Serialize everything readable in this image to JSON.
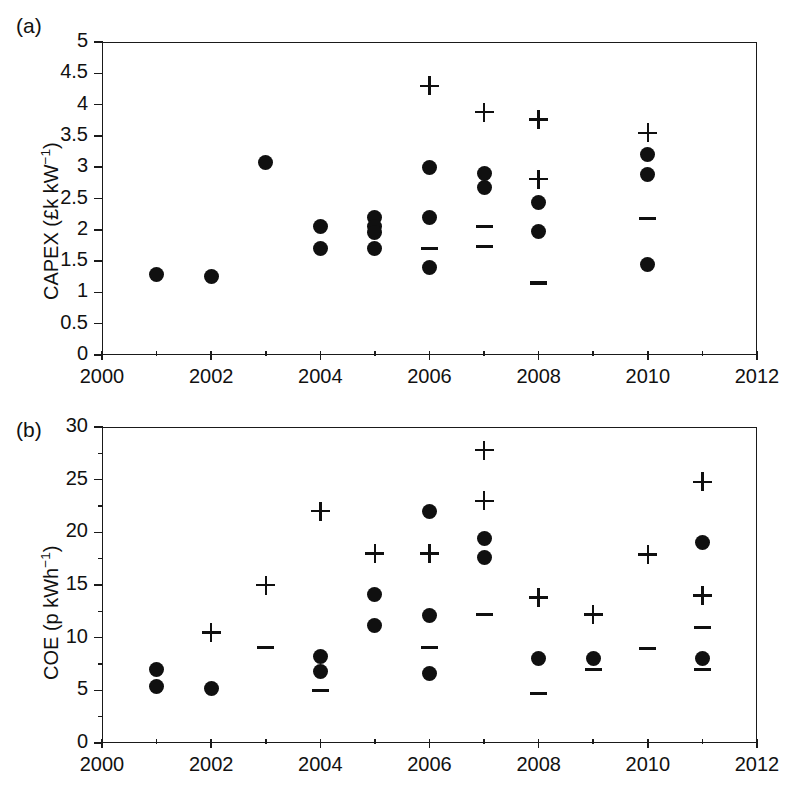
{
  "figure": {
    "panel_a_label": "(a)",
    "panel_b_label": "(b)",
    "caption_fragment": ""
  },
  "chart_data": [
    {
      "id": "panel-a",
      "type": "scatter",
      "title": "(a)",
      "xlabel": "",
      "ylabel": "CAPEX (£k kW-1)",
      "ylabel_html": "CAPEX (£k kW<sup>−1</sup>)",
      "xlim": [
        2000,
        2012
      ],
      "ylim": [
        0,
        5
      ],
      "xticks": [
        2000,
        2002,
        2004,
        2006,
        2008,
        2010,
        2012
      ],
      "xtick_labels": [
        "2000",
        "2002",
        "2004",
        "2006",
        "2008",
        "2010",
        "2012"
      ],
      "xtick_minor": [
        2001,
        2003,
        2005,
        2007,
        2009,
        2011
      ],
      "yticks": [
        0,
        0.5,
        1,
        1.5,
        2,
        2.5,
        3,
        3.5,
        4,
        4.5,
        5
      ],
      "ytick_labels": [
        "0",
        "0.5",
        "1",
        "1.5",
        "2",
        "2.5",
        "3",
        "3.5",
        "4",
        "4.5",
        "5"
      ],
      "grid": false,
      "legend": null,
      "series": [
        {
          "name": "central estimate",
          "marker": "dot",
          "points": [
            {
              "x": 2001,
              "y": 1.28
            },
            {
              "x": 2002,
              "y": 1.26
            },
            {
              "x": 2003,
              "y": 3.07
            },
            {
              "x": 2004,
              "y": 2.05
            },
            {
              "x": 2004,
              "y": 1.7
            },
            {
              "x": 2005,
              "y": 2.2
            },
            {
              "x": 2005,
              "y": 2.05
            },
            {
              "x": 2005,
              "y": 1.95
            },
            {
              "x": 2005,
              "y": 1.7
            },
            {
              "x": 2006,
              "y": 3.0
            },
            {
              "x": 2006,
              "y": 2.19
            },
            {
              "x": 2006,
              "y": 1.4
            },
            {
              "x": 2007,
              "y": 2.9
            },
            {
              "x": 2007,
              "y": 2.67
            },
            {
              "x": 2008,
              "y": 2.43
            },
            {
              "x": 2008,
              "y": 1.98
            },
            {
              "x": 2010,
              "y": 3.2
            },
            {
              "x": 2010,
              "y": 2.88
            },
            {
              "x": 2010,
              "y": 1.45
            }
          ]
        },
        {
          "name": "upper bound",
          "marker": "plus",
          "points": [
            {
              "x": 2006,
              "y": 4.3
            },
            {
              "x": 2007,
              "y": 3.88
            },
            {
              "x": 2008,
              "y": 3.76
            },
            {
              "x": 2008,
              "y": 2.81
            },
            {
              "x": 2010,
              "y": 3.55
            }
          ]
        },
        {
          "name": "lower bound",
          "marker": "minus",
          "points": [
            {
              "x": 2006,
              "y": 1.7
            },
            {
              "x": 2007,
              "y": 2.05
            },
            {
              "x": 2007,
              "y": 1.73
            },
            {
              "x": 2008,
              "y": 1.15
            },
            {
              "x": 2010,
              "y": 2.18
            }
          ]
        }
      ]
    },
    {
      "id": "panel-b",
      "type": "scatter",
      "title": "(b)",
      "xlabel": "",
      "ylabel": "COE (p kWh-1)",
      "ylabel_html": "COE (p kWh<sup>−1</sup>)",
      "xlim": [
        2000,
        2012
      ],
      "ylim": [
        0,
        30
      ],
      "xticks": [
        2000,
        2002,
        2004,
        2006,
        2008,
        2010,
        2012
      ],
      "xtick_labels": [
        "2000",
        "2002",
        "2004",
        "2006",
        "2008",
        "2010",
        "2012"
      ],
      "xtick_minor": [
        2001,
        2003,
        2005,
        2007,
        2009,
        2011
      ],
      "yticks": [
        0,
        5,
        10,
        15,
        20,
        25,
        30
      ],
      "ytick_labels": [
        "0",
        "5",
        "10",
        "15",
        "20",
        "25",
        "30"
      ],
      "ytick_minor": [
        2.5,
        7.5,
        12.5,
        17.5,
        22.5,
        27.5
      ],
      "grid": false,
      "legend": null,
      "series": [
        {
          "name": "central estimate",
          "marker": "dot",
          "points": [
            {
              "x": 2001,
              "y": 7.0
            },
            {
              "x": 2001,
              "y": 5.4
            },
            {
              "x": 2002,
              "y": 5.2
            },
            {
              "x": 2004,
              "y": 8.2
            },
            {
              "x": 2004,
              "y": 6.8
            },
            {
              "x": 2005,
              "y": 14.1
            },
            {
              "x": 2005,
              "y": 11.2
            },
            {
              "x": 2006,
              "y": 22.0
            },
            {
              "x": 2006,
              "y": 12.1
            },
            {
              "x": 2006,
              "y": 6.6
            },
            {
              "x": 2007,
              "y": 19.4
            },
            {
              "x": 2007,
              "y": 17.6
            },
            {
              "x": 2008,
              "y": 8.0
            },
            {
              "x": 2009,
              "y": 8.0
            },
            {
              "x": 2011,
              "y": 19.0
            },
            {
              "x": 2011,
              "y": 8.0
            }
          ]
        },
        {
          "name": "upper bound",
          "marker": "plus",
          "points": [
            {
              "x": 2002,
              "y": 10.5
            },
            {
              "x": 2003,
              "y": 15.0
            },
            {
              "x": 2004,
              "y": 22.0
            },
            {
              "x": 2005,
              "y": 18.0
            },
            {
              "x": 2006,
              "y": 18.0
            },
            {
              "x": 2007,
              "y": 27.8
            },
            {
              "x": 2007,
              "y": 23.0
            },
            {
              "x": 2008,
              "y": 13.8
            },
            {
              "x": 2009,
              "y": 12.2
            },
            {
              "x": 2010,
              "y": 17.9
            },
            {
              "x": 2011,
              "y": 24.8
            },
            {
              "x": 2011,
              "y": 14.0
            }
          ]
        },
        {
          "name": "lower bound",
          "marker": "minus",
          "points": [
            {
              "x": 2003,
              "y": 9.1
            },
            {
              "x": 2004,
              "y": 5.0
            },
            {
              "x": 2006,
              "y": 9.1
            },
            {
              "x": 2007,
              "y": 12.2
            },
            {
              "x": 2008,
              "y": 4.7
            },
            {
              "x": 2009,
              "y": 7.0
            },
            {
              "x": 2010,
              "y": 9.0
            },
            {
              "x": 2011,
              "y": 11.0
            },
            {
              "x": 2011,
              "y": 7.0
            }
          ]
        }
      ]
    }
  ]
}
